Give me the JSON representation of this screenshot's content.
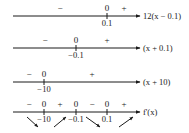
{
  "diagram": {
    "rows": [
      {
        "id": "row1",
        "label": "12(x − 0.1)",
        "y": 16,
        "ticks": [
          {
            "x": 107,
            "label": "0.1"
          }
        ],
        "signs": [
          {
            "x": 60,
            "text": "−"
          },
          {
            "x": 107,
            "text": "0"
          },
          {
            "x": 124,
            "text": "+"
          }
        ]
      },
      {
        "id": "row2",
        "label": "(x + 0.1)",
        "y": 48,
        "ticks": [
          {
            "x": 76,
            "label": "−0.1"
          }
        ],
        "signs": [
          {
            "x": 45,
            "text": "−"
          },
          {
            "x": 76,
            "text": "0"
          },
          {
            "x": 107,
            "text": "+"
          }
        ]
      },
      {
        "id": "row3",
        "label": "(x + 10)",
        "y": 82,
        "ticks": [
          {
            "x": 44,
            "label": "−10"
          }
        ],
        "signs": [
          {
            "x": 29,
            "text": "−"
          },
          {
            "x": 44,
            "text": "0"
          },
          {
            "x": 92,
            "text": "+"
          }
        ]
      },
      {
        "id": "row4",
        "label": "f'(x)",
        "y": 112,
        "ticks": [
          {
            "x": 44,
            "label": "−10"
          },
          {
            "x": 76,
            "label": "−0.1"
          },
          {
            "x": 107,
            "label": "0.1"
          }
        ],
        "signs": [
          {
            "x": 29,
            "text": "−"
          },
          {
            "x": 44,
            "text": "0"
          },
          {
            "x": 60,
            "text": "+"
          },
          {
            "x": 76,
            "text": "0"
          },
          {
            "x": 92,
            "text": "−"
          },
          {
            "x": 107,
            "text": "0"
          },
          {
            "x": 124,
            "text": "+"
          }
        ],
        "arrows": [
          {
            "direction": "decreasing",
            "x1": 27,
            "y1": 117,
            "x2": 38,
            "y2": 127
          },
          {
            "direction": "increasing",
            "x1": 54,
            "y1": 127,
            "x2": 66,
            "y2": 117
          },
          {
            "direction": "decreasing",
            "x1": 86,
            "y1": 117,
            "x2": 100,
            "y2": 127
          },
          {
            "direction": "increasing",
            "x1": 119,
            "y1": 127,
            "x2": 133,
            "y2": 117
          }
        ]
      }
    ],
    "line_start_x": 13,
    "line_end_x": 140,
    "colors": {
      "ink": "#1a1a1a",
      "background": "#ffffff"
    }
  }
}
